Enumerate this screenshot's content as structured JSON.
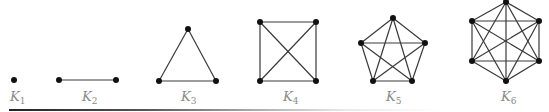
{
  "figure": {
    "graphs": [
      {
        "id": "K1",
        "label_base": "K",
        "label_sub": "1",
        "n": 1,
        "vertices": 1,
        "edges": 0
      },
      {
        "id": "K2",
        "label_base": "K",
        "label_sub": "2",
        "n": 2,
        "vertices": 2,
        "edges": 1
      },
      {
        "id": "K3",
        "label_base": "K",
        "label_sub": "3",
        "n": 3,
        "vertices": 3,
        "edges": 3
      },
      {
        "id": "K4",
        "label_base": "K",
        "label_sub": "4",
        "n": 4,
        "vertices": 4,
        "edges": 6
      },
      {
        "id": "K5",
        "label_base": "K",
        "label_sub": "5",
        "n": 5,
        "vertices": 5,
        "edges": 10
      },
      {
        "id": "K6",
        "label_base": "K",
        "label_sub": "6",
        "n": 6,
        "vertices": 6,
        "edges": 15
      }
    ],
    "colors": {
      "vertex": "#111111",
      "edge": "#3a3a3a",
      "label": "#8a8a8a"
    }
  }
}
